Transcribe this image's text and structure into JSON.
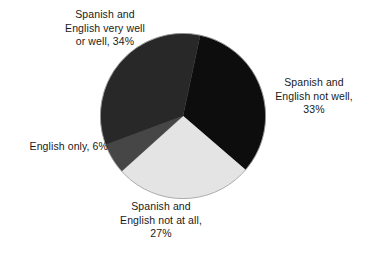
{
  "chart_data": {
    "type": "pie",
    "title": "",
    "subtitle": "",
    "xlabel": "",
    "ylabel": "",
    "legend_position": "none",
    "grid": false,
    "label_format": "{category}, {value}%",
    "total": 100,
    "categories": [
      "Spanish and English not well",
      "Spanish and English not at all",
      "English only",
      "Spanish and English very well or well"
    ],
    "values": [
      33,
      27,
      6,
      34
    ],
    "slices": [
      {
        "category": "Spanish and English not well",
        "value": 33,
        "value_label": "33%",
        "color": "#0d0d0d",
        "start_angle": 12,
        "end_angle": 130.8,
        "label_lines": [
          "Spanish and",
          "English not well,",
          "33%"
        ],
        "label_position": "right"
      },
      {
        "category": "Spanish and English not at all",
        "value": 27,
        "value_label": "27%",
        "color": "#e4e4e4",
        "start_angle": 130.8,
        "end_angle": 228,
        "label_lines": [
          "Spanish and",
          "English not at all,",
          "27%"
        ],
        "label_position": "bottom"
      },
      {
        "category": "English only",
        "value": 6,
        "value_label": "6%",
        "color": "#464646",
        "start_angle": 228,
        "end_angle": 249.6,
        "label_lines": [
          "English only, 6%"
        ],
        "label_position": "left"
      },
      {
        "category": "Spanish and English very well or well",
        "value": 34,
        "value_label": "34%",
        "color": "#282828",
        "start_angle": 249.6,
        "end_angle": 372,
        "label_lines": [
          "Spanish and",
          "English very well",
          "or well, 34%"
        ],
        "label_position": "top-left"
      }
    ],
    "outline_color": "#9a9a9a",
    "background_color": "#ffffff"
  },
  "labels": {
    "very_well": "Spanish and\nEnglish very well\nor well, 34%",
    "not_well": "Spanish and\nEnglish not well,\n33%",
    "english_only": "English only, 6%",
    "not_at_all": "Spanish and\nEnglish not at all,\n27%"
  }
}
